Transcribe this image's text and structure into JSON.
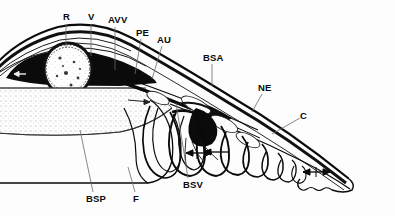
{
  "figure": {
    "background_color": "#fdfdfd",
    "ink_color": "#0a0a0a",
    "leader_color": "#6a6a6a",
    "stipple_color": "#9a9a9a"
  },
  "labels": [
    {
      "key": "R",
      "text": "R",
      "x": 63,
      "y": 12,
      "leader": {
        "x1": 66,
        "y1": 24,
        "x2": 66,
        "y2": 48
      }
    },
    {
      "key": "V",
      "text": "V",
      "x": 88,
      "y": 12,
      "leader": {
        "x1": 91,
        "y1": 24,
        "x2": 91,
        "y2": 56
      }
    },
    {
      "key": "AVV",
      "text": "AVV",
      "x": 108,
      "y": 15,
      "leader": {
        "x1": 115,
        "y1": 27,
        "x2": 115,
        "y2": 70
      }
    },
    {
      "key": "PE",
      "text": "PE",
      "x": 136,
      "y": 28,
      "leader": {
        "x1": 141,
        "y1": 39,
        "x2": 135,
        "y2": 74
      }
    },
    {
      "key": "AU",
      "text": "AU",
      "x": 157,
      "y": 35,
      "leader": {
        "x1": 162,
        "y1": 46,
        "x2": 152,
        "y2": 79
      }
    },
    {
      "key": "BSA",
      "text": "BSA",
      "x": 203,
      "y": 53,
      "leader": {
        "x1": 212,
        "y1": 64,
        "x2": 212,
        "y2": 86
      }
    },
    {
      "key": "NE",
      "text": "NE",
      "x": 258,
      "y": 83,
      "leader": {
        "x1": 262,
        "y1": 94,
        "x2": 252,
        "y2": 112
      }
    },
    {
      "key": "C",
      "text": "C",
      "x": 300,
      "y": 111,
      "leader": {
        "x1": 300,
        "y1": 118,
        "x2": 272,
        "y2": 134
      }
    },
    {
      "key": "BSV",
      "text": "BSV",
      "x": 183,
      "y": 180,
      "leader": {
        "x1": 188,
        "y1": 178,
        "x2": 176,
        "y2": 103
      }
    },
    {
      "key": "BSP",
      "text": "BSP",
      "x": 86,
      "y": 194,
      "leader": {
        "x1": 93,
        "y1": 192,
        "x2": 80,
        "y2": 130
      }
    },
    {
      "key": "F",
      "text": "F",
      "x": 133,
      "y": 194,
      "leader": {
        "x1": 135,
        "y1": 192,
        "x2": 128,
        "y2": 167
      }
    }
  ],
  "structures": {
    "orbit_ovals": [
      {
        "name": "upper-oval",
        "cx": 68,
        "cy": 69,
        "rx": 25,
        "ry": 27
      },
      {
        "name": "lower-left-oval",
        "cx": 45,
        "cy": 110,
        "rx": 24,
        "ry": 18
      },
      {
        "name": "lower-right-oval",
        "cx": 94,
        "cy": 111,
        "rx": 22,
        "ry": 19
      }
    ],
    "gill_loops_count": 8,
    "flow_arrows_count": 3
  }
}
